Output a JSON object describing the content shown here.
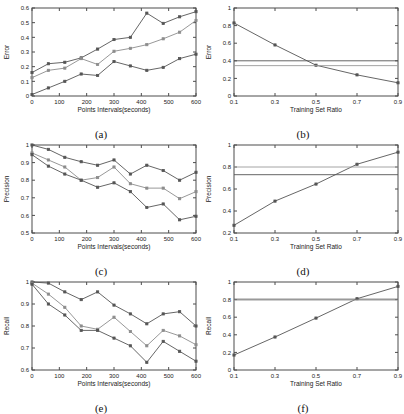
{
  "figure": {
    "panel_count": 6,
    "captions": [
      "(a)",
      "(b)",
      "(c)",
      "(d)",
      "(e)",
      "(f)"
    ]
  },
  "chart_data": [
    {
      "type": "line",
      "panel": "(a)",
      "title": "",
      "xlabel": "Points Intervals(seconds)",
      "ylabel": "Error",
      "x": [
        0,
        60,
        120,
        180,
        240,
        300,
        360,
        420,
        480,
        540,
        600
      ],
      "xlim": [
        0,
        600
      ],
      "ylim": [
        0,
        0.6
      ],
      "xticks": [
        0,
        100,
        200,
        300,
        400,
        500,
        600
      ],
      "yticks": [
        0,
        0.1,
        0.2,
        0.3,
        0.4,
        0.5,
        0.6
      ],
      "xticklabels": [
        "0",
        "100",
        "200",
        "300",
        "400",
        "500",
        "600"
      ],
      "yticklabels": [
        "0",
        "0.1",
        "0.2",
        "0.3",
        "0.4",
        "0.5",
        "0.6"
      ],
      "grid": false,
      "legend": "none",
      "series": [
        {
          "name": "upper",
          "color": "#555555",
          "values": [
            0.16,
            0.22,
            0.23,
            0.26,
            0.32,
            0.385,
            0.4,
            0.565,
            0.495,
            0.54,
            0.575
          ]
        },
        {
          "name": "middle",
          "color": "#8c8c8c",
          "values": [
            0.125,
            0.175,
            0.19,
            0.255,
            0.215,
            0.305,
            0.325,
            0.35,
            0.39,
            0.435,
            0.515
          ]
        },
        {
          "name": "lower",
          "color": "#555555",
          "values": [
            0.01,
            0.055,
            0.1,
            0.15,
            0.14,
            0.235,
            0.205,
            0.175,
            0.195,
            0.255,
            0.285
          ]
        }
      ]
    },
    {
      "type": "line",
      "panel": "(b)",
      "title": "",
      "xlabel": "Training Set Ratio",
      "ylabel": "Error",
      "x": [
        0.1,
        0.3,
        0.5,
        0.7,
        0.9
      ],
      "xlim": [
        0.1,
        0.9
      ],
      "ylim": [
        0,
        1
      ],
      "xticks": [
        0.1,
        0.3,
        0.5,
        0.7,
        0.9
      ],
      "yticks": [
        0,
        0.2,
        0.4,
        0.6,
        0.8,
        1
      ],
      "xticklabels": [
        "0.1",
        "0.3",
        "0.5",
        "0.7",
        "0.9"
      ],
      "yticklabels": [
        "0",
        "0.2",
        "0.4",
        "0.6",
        "0.8",
        "1"
      ],
      "grid": false,
      "legend": "none",
      "series": [
        {
          "name": "curve",
          "color": "#555555",
          "values": [
            0.83,
            0.58,
            0.35,
            0.24,
            0.15
          ]
        },
        {
          "name": "baseline-high",
          "color": "#555555",
          "constant": 0.4
        },
        {
          "name": "baseline-low",
          "color": "#9a9a9a",
          "constant": 0.345
        }
      ]
    },
    {
      "type": "line",
      "panel": "(c)",
      "title": "",
      "xlabel": "Points Intervals(seconds)",
      "ylabel": "Precision",
      "x": [
        0,
        60,
        120,
        180,
        240,
        300,
        360,
        420,
        480,
        540,
        600
      ],
      "xlim": [
        0,
        600
      ],
      "ylim": [
        0.5,
        1
      ],
      "xticks": [
        0,
        100,
        200,
        300,
        400,
        500,
        600
      ],
      "yticks": [
        0.5,
        0.6,
        0.7,
        0.8,
        0.9,
        1
      ],
      "xticklabels": [
        "0",
        "100",
        "200",
        "300",
        "400",
        "500",
        "600"
      ],
      "yticklabels": [
        "0.5",
        "0.6",
        "0.7",
        "0.8",
        "0.9",
        "1"
      ],
      "grid": false,
      "legend": "none",
      "series": [
        {
          "name": "upper",
          "color": "#555555",
          "values": [
            1.0,
            0.975,
            0.93,
            0.905,
            0.885,
            0.915,
            0.835,
            0.885,
            0.855,
            0.8,
            0.845
          ]
        },
        {
          "name": "middle",
          "color": "#8c8c8c",
          "values": [
            0.955,
            0.915,
            0.875,
            0.8,
            0.815,
            0.875,
            0.78,
            0.755,
            0.755,
            0.695,
            0.735
          ]
        },
        {
          "name": "lower",
          "color": "#555555",
          "values": [
            0.945,
            0.88,
            0.835,
            0.8,
            0.76,
            0.785,
            0.735,
            0.645,
            0.665,
            0.575,
            0.595
          ]
        }
      ]
    },
    {
      "type": "line",
      "panel": "(d)",
      "title": "",
      "xlabel": "Training Set Ratio",
      "ylabel": "Precision",
      "x": [
        0.1,
        0.3,
        0.5,
        0.7,
        0.9
      ],
      "xlim": [
        0.1,
        0.9
      ],
      "ylim": [
        0.2,
        1
      ],
      "xticks": [
        0.1,
        0.3,
        0.5,
        0.7,
        0.9
      ],
      "yticks": [
        0.2,
        0.4,
        0.6,
        0.8,
        1
      ],
      "xticklabels": [
        "0.1",
        "0.3",
        "0.5",
        "0.7",
        "0.9"
      ],
      "yticklabels": [
        "0.2",
        "0.4",
        "0.6",
        "0.8",
        "1"
      ],
      "grid": false,
      "legend": "none",
      "series": [
        {
          "name": "curve",
          "color": "#555555",
          "values": [
            0.27,
            0.49,
            0.645,
            0.825,
            0.935
          ]
        },
        {
          "name": "baseline-high",
          "color": "#9a9a9a",
          "constant": 0.8
        },
        {
          "name": "baseline-low",
          "color": "#555555",
          "constant": 0.73
        }
      ]
    },
    {
      "type": "line",
      "panel": "(e)",
      "title": "",
      "xlabel": "Points Intervals(seconds)",
      "ylabel": "Recall",
      "x": [
        0,
        60,
        120,
        180,
        240,
        300,
        360,
        420,
        480,
        540,
        600
      ],
      "xlim": [
        0,
        600
      ],
      "ylim": [
        0.6,
        1
      ],
      "xticks": [
        0,
        100,
        200,
        300,
        400,
        500,
        600
      ],
      "yticks": [
        0.6,
        0.7,
        0.8,
        0.9,
        1
      ],
      "xticklabels": [
        "0",
        "100",
        "200",
        "300",
        "400",
        "500",
        "600"
      ],
      "yticklabels": [
        "0.6",
        "0.7",
        "0.8",
        "0.9",
        "1"
      ],
      "grid": false,
      "legend": "none",
      "series": [
        {
          "name": "upper",
          "color": "#555555",
          "values": [
            1.0,
            0.995,
            0.955,
            0.92,
            0.955,
            0.895,
            0.855,
            0.81,
            0.855,
            0.865,
            0.8
          ]
        },
        {
          "name": "middle",
          "color": "#8c8c8c",
          "values": [
            0.995,
            0.945,
            0.885,
            0.8,
            0.785,
            0.84,
            0.775,
            0.71,
            0.78,
            0.755,
            0.715
          ]
        },
        {
          "name": "lower",
          "color": "#555555",
          "values": [
            0.99,
            0.9,
            0.85,
            0.78,
            0.78,
            0.745,
            0.71,
            0.635,
            0.73,
            0.685,
            0.64
          ]
        }
      ]
    },
    {
      "type": "line",
      "panel": "(f)",
      "title": "",
      "xlabel": "Training Set Ratio",
      "ylabel": "Recall",
      "x": [
        0.1,
        0.3,
        0.5,
        0.7,
        0.9
      ],
      "xlim": [
        0.1,
        0.9
      ],
      "ylim": [
        0,
        1
      ],
      "xticks": [
        0.1,
        0.3,
        0.5,
        0.7,
        0.9
      ],
      "yticks": [
        0,
        0.2,
        0.4,
        0.6,
        0.8,
        1
      ],
      "xticklabels": [
        "0.1",
        "0.3",
        "0.5",
        "0.7",
        "0.9"
      ],
      "yticklabels": [
        "0",
        "0.2",
        "0.4",
        "0.6",
        "0.8",
        "1"
      ],
      "grid": false,
      "legend": "none",
      "series": [
        {
          "name": "curve",
          "color": "#555555",
          "values": [
            0.17,
            0.375,
            0.59,
            0.81,
            0.95
          ]
        },
        {
          "name": "baseline-high",
          "color": "#555555",
          "constant": 0.805
        },
        {
          "name": "baseline-low",
          "color": "#9a9a9a",
          "constant": 0.795
        }
      ]
    }
  ]
}
